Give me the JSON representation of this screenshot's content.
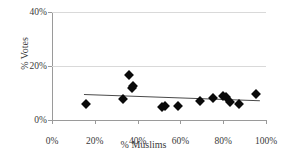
{
  "chart_data": {
    "type": "scatter",
    "title": "",
    "xlabel": "% Muslims",
    "ylabel": "% Votes",
    "xlim": [
      0,
      100
    ],
    "ylim": [
      0,
      40
    ],
    "xticks": [
      "0%",
      "20%",
      "40%",
      "60%",
      "80%",
      "100%"
    ],
    "xtick_values": [
      0,
      20,
      40,
      60,
      80,
      100
    ],
    "yticks": [
      "0%",
      "20%",
      "40%"
    ],
    "ytick_values": [
      0,
      20,
      40
    ],
    "grid": "horizontal",
    "legend": "none",
    "marker": "filled-diamond",
    "marker_color": "#0a0a0a",
    "trendline_color": "#4a4a4a",
    "gridline_color": "#d9d9d9",
    "axis_color": "#9a9a9a",
    "points": [
      {
        "x": 16.0,
        "y": 5.8
      },
      {
        "x": 33.0,
        "y": 7.8
      },
      {
        "x": 36.0,
        "y": 16.5
      },
      {
        "x": 37.5,
        "y": 11.8
      },
      {
        "x": 38.0,
        "y": 12.5
      },
      {
        "x": 51.5,
        "y": 5.0
      },
      {
        "x": 53.0,
        "y": 5.2
      },
      {
        "x": 59.0,
        "y": 5.1
      },
      {
        "x": 69.0,
        "y": 7.2
      },
      {
        "x": 75.0,
        "y": 8.2
      },
      {
        "x": 80.0,
        "y": 8.8
      },
      {
        "x": 81.5,
        "y": 8.5
      },
      {
        "x": 83.0,
        "y": 6.8
      },
      {
        "x": 87.5,
        "y": 5.9
      },
      {
        "x": 95.5,
        "y": 9.8
      }
    ],
    "trendline": {
      "x0": 15.0,
      "y0": 9.6,
      "x1": 97.0,
      "y1": 7.3
    }
  }
}
